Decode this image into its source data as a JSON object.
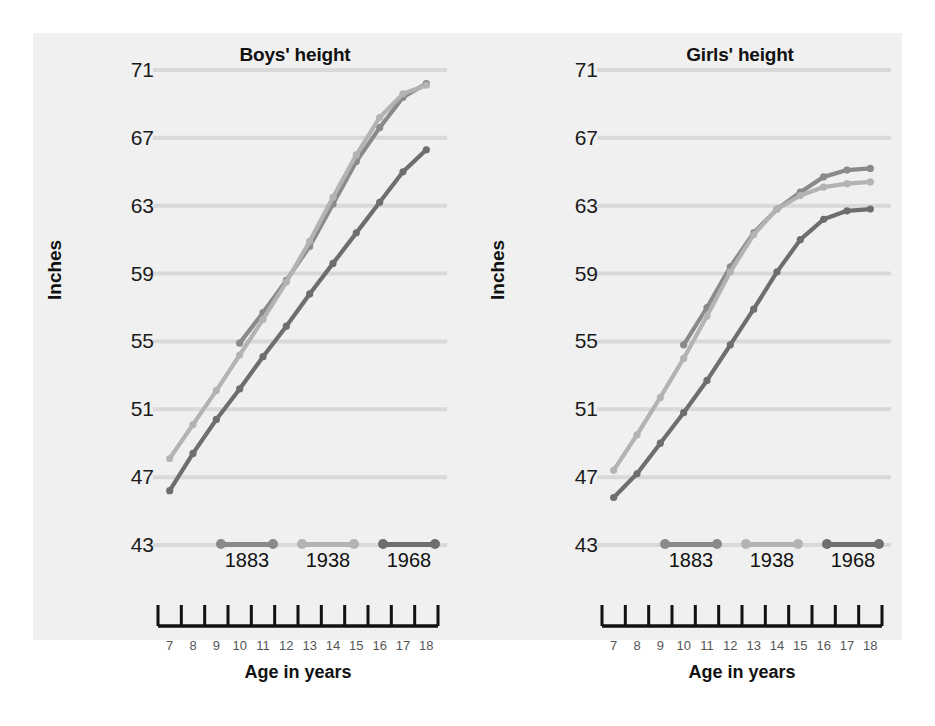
{
  "figure": {
    "background_color": "#f0f0f0",
    "page_color": "#ffffff"
  },
  "series_colors": {
    "1883": "#8a8a8a",
    "1938": "#b3b3b3",
    "1968": "#6e6e6e"
  },
  "legend": {
    "items": [
      {
        "label": "1883",
        "color": "#8a8a8a"
      },
      {
        "label": "1938",
        "color": "#b3b3b3"
      },
      {
        "label": "1968",
        "color": "#6e6e6e"
      }
    ]
  },
  "axes": {
    "ylabel": "Inches",
    "xlabel": "Age in years",
    "yticks": [
      "71",
      "67",
      "63",
      "59",
      "55",
      "51",
      "47",
      "43"
    ],
    "xticks": [
      "7",
      "8",
      "9",
      "10",
      "11",
      "12",
      "13",
      "14",
      "15",
      "16",
      "17",
      "18"
    ]
  },
  "chart_data": [
    {
      "type": "line",
      "title": "Boys' height",
      "xlabel": "Age in years",
      "ylabel": "Inches",
      "xlim": [
        6.5,
        18.5
      ],
      "ylim": [
        43,
        71
      ],
      "grid": true,
      "legend_position": "inside-bottom",
      "x": [
        7,
        8,
        9,
        10,
        11,
        12,
        13,
        14,
        15,
        16,
        17,
        18
      ],
      "series": [
        {
          "name": "1883",
          "color": "#8a8a8a",
          "x": [
            10,
            11,
            12,
            13,
            14,
            15,
            16,
            17,
            18
          ],
          "values": [
            54.9,
            56.7,
            58.6,
            60.6,
            63.1,
            65.6,
            67.6,
            69.4,
            70.2
          ]
        },
        {
          "name": "1938",
          "color": "#b3b3b3",
          "x": [
            7,
            8,
            9,
            10,
            11,
            12,
            13,
            14,
            15,
            16,
            17,
            18
          ],
          "values": [
            48.1,
            50.1,
            52.1,
            54.2,
            56.3,
            58.5,
            60.9,
            63.5,
            66.0,
            68.2,
            69.6,
            70.1
          ]
        },
        {
          "name": "1968",
          "color": "#6e6e6e",
          "x": [
            7,
            8,
            9,
            10,
            11,
            12,
            13,
            14,
            15,
            16,
            17,
            18
          ],
          "values": [
            46.2,
            48.4,
            50.4,
            52.2,
            54.1,
            55.9,
            57.8,
            59.6,
            61.4,
            63.2,
            65.0,
            66.3
          ]
        }
      ]
    },
    {
      "type": "line",
      "title": "Girls' height",
      "xlabel": "Age in years",
      "ylabel": "Inches",
      "xlim": [
        6.5,
        18.5
      ],
      "ylim": [
        43,
        71
      ],
      "grid": true,
      "legend_position": "inside-bottom",
      "x": [
        7,
        8,
        9,
        10,
        11,
        12,
        13,
        14,
        15,
        16,
        17,
        18
      ],
      "series": [
        {
          "name": "1883",
          "color": "#8a8a8a",
          "x": [
            10,
            11,
            12,
            13,
            14,
            15,
            16,
            17,
            18
          ],
          "values": [
            54.8,
            57.0,
            59.4,
            61.4,
            62.8,
            63.8,
            64.7,
            65.1,
            65.2
          ]
        },
        {
          "name": "1938",
          "color": "#b3b3b3",
          "x": [
            7,
            8,
            9,
            10,
            11,
            12,
            13,
            14,
            15,
            16,
            17,
            18
          ],
          "values": [
            47.4,
            49.5,
            51.7,
            54.0,
            56.5,
            59.1,
            61.3,
            62.8,
            63.6,
            64.1,
            64.3,
            64.4
          ]
        },
        {
          "name": "1968",
          "color": "#6e6e6e",
          "x": [
            7,
            8,
            9,
            10,
            11,
            12,
            13,
            14,
            15,
            16,
            17,
            18
          ],
          "values": [
            45.8,
            47.2,
            49.0,
            50.8,
            52.7,
            54.8,
            56.9,
            59.1,
            61.0,
            62.2,
            62.7,
            62.8
          ]
        }
      ]
    }
  ]
}
